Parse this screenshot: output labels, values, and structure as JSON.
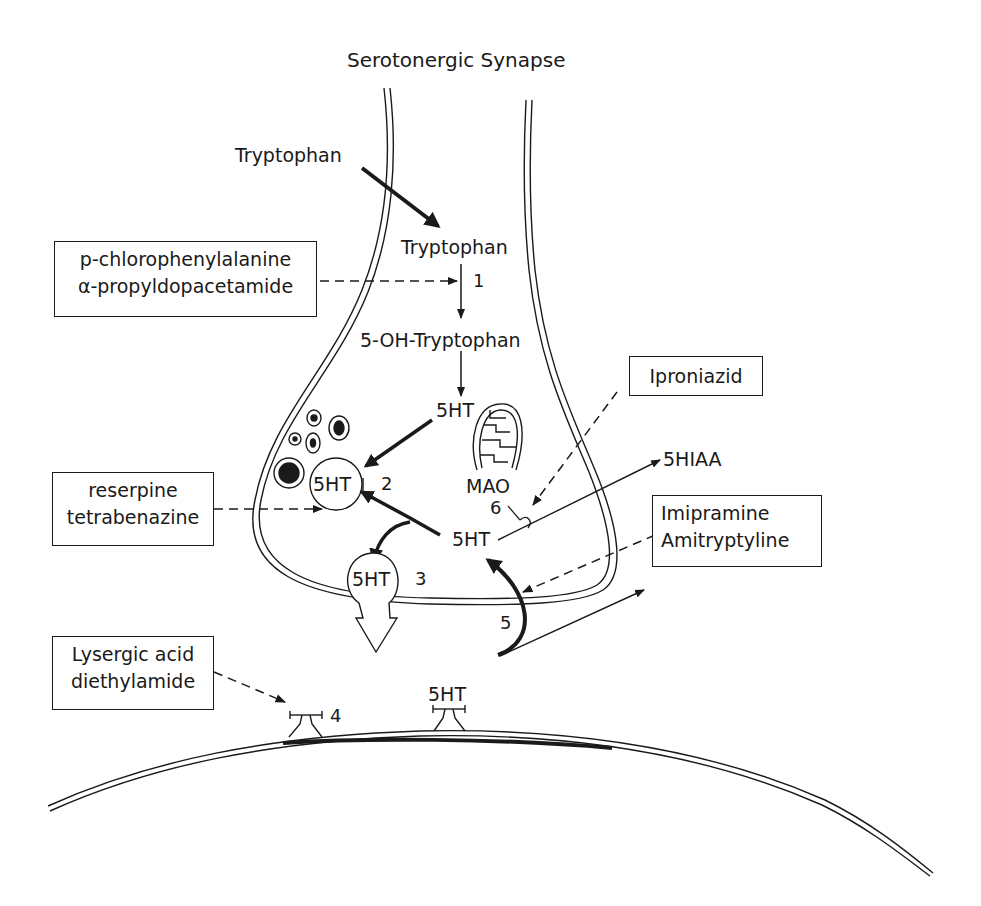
{
  "title": "Serotonergic Synapse",
  "labels": {
    "tryptophan_outside": "Tryptophan",
    "tryptophan_inside": "Tryptophan",
    "five_oh_tryptophan": "5-OH-Tryptophan",
    "fivehht_cytoplasm": "5HT",
    "fivehht_vesicle": "5HT",
    "fivehht_free": "5HT",
    "fivehht_exocytosis": "5HT",
    "fivehht_receptor": "5HT",
    "mao": "MAO",
    "fivehiaa": "5HIAA"
  },
  "step_numbers": {
    "s1": "1",
    "s2": "2",
    "s3": "3",
    "s4": "4",
    "s5": "5",
    "s6": "6"
  },
  "drug_boxes": {
    "synthesis_inhibitors": [
      "p-chlorophenylalanine",
      "α-propyldopacetamide"
    ],
    "storage_inhibitors": [
      "reserpine",
      "tetrabenazine"
    ],
    "mao_inhibitor": [
      "Iproniazid"
    ],
    "reuptake_inhibitors": [
      "Imipramine",
      "Amitryptyline"
    ],
    "receptor_agent": [
      "Lysergic acid",
      "diethylamide"
    ]
  },
  "colors": {
    "ink": "#1a1a1a",
    "background": "#ffffff"
  }
}
